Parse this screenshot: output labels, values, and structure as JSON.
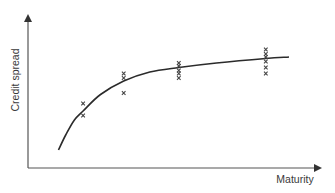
{
  "chart_data": {
    "type": "scatter",
    "title": "",
    "xlabel": "Maturity",
    "ylabel": "Credit spread",
    "grid": false,
    "legend": null,
    "ticks": {
      "x": [],
      "y": []
    },
    "axis_ranges": {
      "x": [
        0,
        10
      ],
      "y": [
        0,
        10
      ]
    },
    "colors": {
      "axis": "#555555",
      "curve": "#2b2b2b",
      "marker": "#444444"
    },
    "series": [
      {
        "name": "observed spreads",
        "kind": "scatter",
        "marker": "x",
        "points": [
          {
            "x": 1.9,
            "y": 4.3
          },
          {
            "x": 1.9,
            "y": 3.5
          },
          {
            "x": 3.3,
            "y": 6.3
          },
          {
            "x": 3.3,
            "y": 6.0
          },
          {
            "x": 3.3,
            "y": 5.0
          },
          {
            "x": 5.2,
            "y": 7.0
          },
          {
            "x": 5.2,
            "y": 6.8
          },
          {
            "x": 5.2,
            "y": 6.5
          },
          {
            "x": 5.2,
            "y": 6.3
          },
          {
            "x": 5.2,
            "y": 6.0
          },
          {
            "x": 8.2,
            "y": 7.9
          },
          {
            "x": 8.2,
            "y": 7.6
          },
          {
            "x": 8.2,
            "y": 7.4
          },
          {
            "x": 8.2,
            "y": 7.1
          },
          {
            "x": 8.2,
            "y": 6.7
          },
          {
            "x": 8.2,
            "y": 6.3
          }
        ]
      },
      {
        "name": "fitted curve",
        "kind": "line",
        "points": [
          {
            "x": 1.05,
            "y": 1.2
          },
          {
            "x": 1.3,
            "y": 2.2
          },
          {
            "x": 1.6,
            "y": 3.2
          },
          {
            "x": 1.9,
            "y": 3.8
          },
          {
            "x": 2.5,
            "y": 4.9
          },
          {
            "x": 3.3,
            "y": 5.8
          },
          {
            "x": 4.2,
            "y": 6.4
          },
          {
            "x": 5.2,
            "y": 6.7
          },
          {
            "x": 6.5,
            "y": 7.0
          },
          {
            "x": 8.2,
            "y": 7.3
          },
          {
            "x": 9.0,
            "y": 7.4
          }
        ]
      }
    ]
  }
}
